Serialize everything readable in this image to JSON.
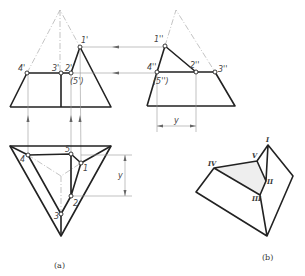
{
  "figure": {
    "subfigures": [
      {
        "id": "a",
        "caption": "(a)",
        "views": {
          "front_view": {
            "point_labels": [
              "1'",
              "2'",
              "3'",
              "4'",
              "(5')"
            ]
          },
          "side_view": {
            "point_labels": [
              "1''",
              "2''",
              "3''",
              "4''",
              "(5'')"
            ],
            "dimension_label": "y"
          },
          "top_view": {
            "point_labels": [
              "1",
              "2",
              "3",
              "4",
              "5"
            ],
            "dimension_label": "y"
          }
        }
      },
      {
        "id": "b",
        "caption": "(b)",
        "point_labels": [
          "I",
          "II",
          "III",
          "IV",
          "V"
        ]
      }
    ],
    "labels": {
      "front": {
        "p1": "1'",
        "p2": "2'",
        "p3": "3'",
        "p4": "4'",
        "p5": "(5')"
      },
      "side": {
        "p1": "1''",
        "p2": "2''",
        "p3": "3''",
        "p4": "4''",
        "p5": "(5'')",
        "dim": "y"
      },
      "top": {
        "p1": "1",
        "p2": "2",
        "p3": "3",
        "p4": "4",
        "p5": "5",
        "dim": "y"
      },
      "iso": {
        "p1": "I",
        "p2": "II",
        "p3": "III",
        "p4": "IV",
        "p5": "V"
      },
      "caption_a": "(a)",
      "caption_b": "(b)"
    },
    "colors": {
      "line": "#222222",
      "construction": "#999999",
      "hidden_face": "#eeeeee",
      "background": "#ffffff"
    }
  }
}
